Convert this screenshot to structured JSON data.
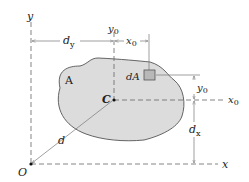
{
  "diagram": {
    "type": "parallel-axis-theorem",
    "colors": {
      "region_fill": "#dcdcdc",
      "region_stroke": "#555555",
      "element_fill": "#b8b8b8",
      "axis_stroke": "#666666",
      "line_stroke": "#777777",
      "text": "#222222"
    },
    "labels": {
      "y_axis": "y",
      "x_axis": "x",
      "origin": "O",
      "centroid": "C",
      "area": "A",
      "element": "dA",
      "dist_d": "d",
      "dy_main": "d",
      "dy_sub": "y",
      "dx_main": "d",
      "dx_sub": "x",
      "y0_top_main": "y",
      "y0_top_sub": "0",
      "x0_top_main": "x",
      "x0_top_sub": "0",
      "y0_right_main": "y",
      "y0_right_sub": "0",
      "x0_axis_main": "x",
      "x0_axis_sub": "0"
    }
  }
}
